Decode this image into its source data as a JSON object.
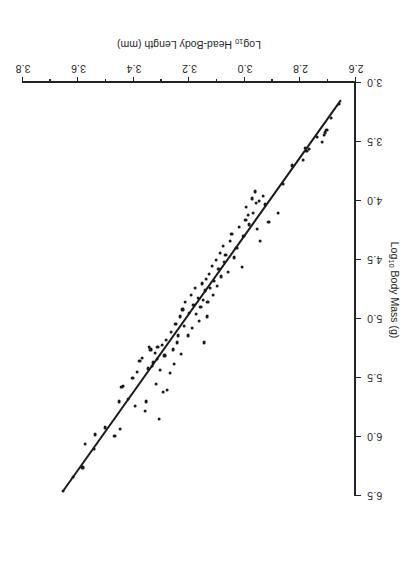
{
  "figure": {
    "orientation_note": "rotated-180",
    "point_color": "#1a1a1a",
    "line_color": "#1a1a1a"
  },
  "chart_data": {
    "type": "scatter",
    "title": "",
    "xlabel": "Log10 Head-Body Length (mm)",
    "ylabel": "Log10 Body Mass (g)",
    "xlabel_parts": {
      "prefix": "Log",
      "sub": "10",
      "suffix": " Head-Body Length  (mm)"
    },
    "ylabel_parts": {
      "prefix": "Log",
      "sub": "10",
      "suffix": " Body Mass  (g)"
    },
    "xlim": [
      2.6,
      3.8
    ],
    "ylim": [
      3.0,
      6.5
    ],
    "xticks": [
      2.6,
      2.8,
      3.0,
      3.2,
      3.4,
      3.6,
      3.8
    ],
    "xtick_labels": [
      "2.6",
      "2.8",
      "3.0",
      "3.2",
      "3.4",
      "3.6",
      "3.8"
    ],
    "xminor_ticks": [
      2.7,
      2.9,
      3.1,
      3.3,
      3.5,
      3.7
    ],
    "yticks": [
      3.0,
      3.5,
      4.0,
      4.5,
      5.0,
      5.5,
      6.0,
      6.5
    ],
    "ytick_labels": [
      "3.0",
      "3.5",
      "4.0",
      "4.5",
      "5.0",
      "5.5",
      "6.0",
      "6.5"
    ],
    "grid": false,
    "legend": null,
    "fit_line": {
      "type": "linear-regression",
      "x": [
        2.655,
        3.655
      ],
      "y": [
        3.15,
        6.46
      ]
    },
    "points": [
      [
        3.655,
        6.46
      ],
      [
        3.62,
        6.34
      ],
      [
        3.585,
        6.26
      ],
      [
        3.575,
        6.06
      ],
      [
        3.545,
        6.1
      ],
      [
        3.54,
        5.98
      ],
      [
        3.505,
        5.92
      ],
      [
        3.47,
        5.99
      ],
      [
        3.455,
        5.7
      ],
      [
        3.45,
        5.93
      ],
      [
        3.445,
        5.58
      ],
      [
        3.44,
        5.57
      ],
      [
        3.42,
        5.68
      ],
      [
        3.405,
        5.5
      ],
      [
        3.395,
        5.74
      ],
      [
        3.39,
        5.45
      ],
      [
        3.38,
        5.36
      ],
      [
        3.37,
        5.33
      ],
      [
        3.36,
        5.78
      ],
      [
        3.355,
        5.7
      ],
      [
        3.35,
        5.42
      ],
      [
        3.345,
        5.24
      ],
      [
        3.34,
        5.26
      ],
      [
        3.335,
        5.4
      ],
      [
        3.33,
        5.37
      ],
      [
        3.325,
        5.29
      ],
      [
        3.32,
        5.55
      ],
      [
        3.318,
        5.34
      ],
      [
        3.315,
        5.24
      ],
      [
        3.31,
        5.85
      ],
      [
        3.305,
        5.43
      ],
      [
        3.3,
        5.22
      ],
      [
        3.295,
        5.62
      ],
      [
        3.29,
        5.31
      ],
      [
        3.285,
        5.18
      ],
      [
        3.28,
        5.6
      ],
      [
        3.27,
        5.46
      ],
      [
        3.265,
        5.11
      ],
      [
        3.26,
        5.26
      ],
      [
        3.255,
        5.38
      ],
      [
        3.25,
        5.04
      ],
      [
        3.245,
        5.2
      ],
      [
        3.24,
        5.14
      ],
      [
        3.235,
        4.98
      ],
      [
        3.23,
        5.3
      ],
      [
        3.225,
        4.92
      ],
      [
        3.22,
        5.06
      ],
      [
        3.215,
        4.86
      ],
      [
        3.205,
        5.14
      ],
      [
        3.2,
        4.95
      ],
      [
        3.195,
        4.8
      ],
      [
        3.19,
        5.08
      ],
      [
        3.185,
        4.88
      ],
      [
        3.18,
        4.74
      ],
      [
        3.175,
        4.96
      ],
      [
        3.17,
        4.82
      ],
      [
        3.165,
        5.02
      ],
      [
        3.16,
        4.9
      ],
      [
        3.155,
        4.7
      ],
      [
        3.15,
        4.84
      ],
      [
        3.148,
        5.2
      ],
      [
        3.145,
        4.76
      ],
      [
        3.14,
        4.66
      ],
      [
        3.138,
        4.98
      ],
      [
        3.135,
        4.86
      ],
      [
        3.13,
        4.62
      ],
      [
        3.125,
        4.74
      ],
      [
        3.12,
        4.55
      ],
      [
        3.115,
        4.8
      ],
      [
        3.11,
        4.68
      ],
      [
        3.105,
        4.5
      ],
      [
        3.1,
        4.72
      ],
      [
        3.095,
        4.58
      ],
      [
        3.09,
        4.44
      ],
      [
        3.085,
        4.64
      ],
      [
        3.08,
        4.38
      ],
      [
        3.075,
        4.52
      ],
      [
        3.07,
        4.46
      ],
      [
        3.06,
        4.6
      ],
      [
        3.055,
        4.34
      ],
      [
        3.048,
        4.28
      ],
      [
        3.04,
        4.48
      ],
      [
        3.03,
        4.4
      ],
      [
        3.022,
        4.22
      ],
      [
        3.01,
        4.56
      ],
      [
        3.005,
        4.3
      ],
      [
        2.998,
        4.16
      ],
      [
        2.995,
        4.05
      ],
      [
        2.99,
        4.12
      ],
      [
        2.985,
        4.2
      ],
      [
        2.975,
        3.98
      ],
      [
        2.97,
        4.1
      ],
      [
        2.965,
        3.92
      ],
      [
        2.96,
        4.02
      ],
      [
        2.955,
        4.24
      ],
      [
        2.948,
        4.0
      ],
      [
        2.945,
        4.34
      ],
      [
        2.935,
        3.96
      ],
      [
        2.928,
        4.03
      ],
      [
        2.915,
        4.18
      ],
      [
        2.88,
        4.1
      ],
      [
        2.862,
        3.86
      ],
      [
        2.83,
        3.7
      ],
      [
        2.79,
        3.65
      ],
      [
        2.782,
        3.55
      ],
      [
        2.778,
        3.58
      ],
      [
        2.768,
        3.56
      ],
      [
        2.74,
        3.46
      ],
      [
        2.722,
        3.5
      ],
      [
        2.715,
        3.44
      ],
      [
        2.71,
        3.42
      ],
      [
        2.706,
        3.4
      ],
      [
        2.69,
        3.3
      ],
      [
        2.66,
        3.18
      ]
    ]
  }
}
